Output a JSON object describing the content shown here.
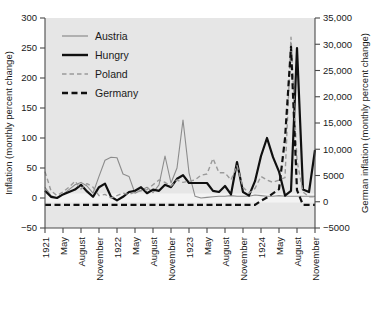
{
  "chart_data": {
    "type": "line",
    "title": "",
    "xlabel": "",
    "ylabel": "Inflation (monthly percent change)",
    "y2label": "German inflation (monthly percent change)",
    "grid": false,
    "legend_position": "top-left",
    "ylim": [
      -50,
      300
    ],
    "y2lim": [
      -5000,
      35000
    ],
    "yticks": [
      "300",
      "250",
      "200",
      "150",
      "100",
      "50",
      "0",
      "-50"
    ],
    "ytick_values": [
      300,
      250,
      200,
      150,
      100,
      50,
      0,
      -50
    ],
    "y2ticks": [
      "35,000",
      "30,000",
      "25,000",
      "20,000",
      "15,000",
      "10,000",
      "5000",
      "0",
      "-5000"
    ],
    "y2tick_values": [
      35000,
      30000,
      25000,
      20000,
      15000,
      10000,
      5000,
      0,
      -5000
    ],
    "xticks": [
      "1921",
      "May",
      "August",
      "November",
      "1922",
      "May",
      "August",
      "November",
      "1923",
      "May",
      "August",
      "November",
      "1924",
      "May",
      "August",
      "November"
    ],
    "x": [
      "1921-02",
      "1921-03",
      "1921-04",
      "1921-05",
      "1921-06",
      "1921-07",
      "1921-08",
      "1921-09",
      "1921-10",
      "1921-11",
      "1921-12",
      "1922-01",
      "1922-02",
      "1922-03",
      "1922-04",
      "1922-05",
      "1922-06",
      "1922-07",
      "1922-08",
      "1922-09",
      "1922-10",
      "1922-11",
      "1922-12",
      "1923-01",
      "1923-02",
      "1923-03",
      "1923-04",
      "1923-05",
      "1923-06",
      "1923-07",
      "1923-08",
      "1923-09",
      "1923-10",
      "1923-11",
      "1923-12",
      "1924-01",
      "1924-02",
      "1924-03",
      "1924-04",
      "1924-05",
      "1924-06",
      "1924-07",
      "1924-08",
      "1924-09",
      "1924-10",
      "1924-11"
    ],
    "series": [
      {
        "name": "Austria",
        "color": "#8c8c8c",
        "style": "solid",
        "width": 1.1,
        "axis": "left",
        "values": [
          18,
          4,
          0,
          6,
          14,
          22,
          26,
          20,
          8,
          36,
          63,
          68,
          67,
          40,
          36,
          8,
          13,
          18,
          9,
          22,
          70,
          25,
          50,
          130,
          42,
          3,
          0,
          1,
          2,
          3,
          3,
          4,
          3,
          3,
          3,
          5,
          4,
          3,
          3,
          4,
          3,
          3,
          3,
          3,
          3,
          3
        ]
      },
      {
        "name": "Hungry",
        "color": "#101010",
        "style": "solid",
        "width": 2.2,
        "axis": "left",
        "values": [
          12,
          2,
          0,
          6,
          10,
          14,
          22,
          11,
          2,
          18,
          24,
          2,
          -4,
          2,
          10,
          12,
          18,
          8,
          14,
          12,
          22,
          18,
          32,
          38,
          25,
          25,
          25,
          25,
          12,
          10,
          20,
          6,
          60,
          10,
          4,
          28,
          70,
          100,
          68,
          44,
          4,
          12,
          250,
          14,
          10,
          80
        ]
      },
      {
        "name": "Poland",
        "color": "#9a9a9a",
        "style": "dashed",
        "width": 1.4,
        "axis": "left",
        "values": [
          44,
          12,
          4,
          10,
          18,
          28,
          15,
          24,
          18,
          4,
          6,
          0,
          4,
          8,
          6,
          10,
          12,
          14,
          22,
          30,
          26,
          20,
          30,
          26,
          28,
          30,
          38,
          40,
          66,
          42,
          42,
          30,
          54,
          18,
          8,
          16,
          36,
          30,
          26,
          30,
          34,
          268,
          62,
          10,
          2,
          2
        ]
      },
      {
        "name": "Germany",
        "color": "#101010",
        "style": "dashed",
        "width": 2.2,
        "axis": "right",
        "values": [
          -600,
          -600,
          -600,
          -600,
          -600,
          -600,
          -600,
          -600,
          -600,
          -600,
          -600,
          -600,
          -600,
          -600,
          -600,
          -600,
          -600,
          -600,
          -600,
          -600,
          -600,
          -600,
          -600,
          -600,
          -600,
          -600,
          -600,
          -600,
          -600,
          -600,
          -600,
          -600,
          -600,
          -600,
          -600,
          -600,
          200,
          800,
          1600,
          2400,
          12000,
          29500,
          2200,
          -600,
          -600,
          -600
        ]
      }
    ],
    "legend": [
      {
        "label": "Austria",
        "color": "#8c8c8c",
        "style": "solid",
        "width": 1.2
      },
      {
        "label": "Hungry",
        "color": "#101010",
        "style": "solid",
        "width": 2.4
      },
      {
        "label": "Poland",
        "color": "#9a9a9a",
        "style": "dashed",
        "width": 1.6
      },
      {
        "label": "Germany",
        "color": "#101010",
        "style": "dashed",
        "width": 2.4
      }
    ],
    "colors": {
      "plot_background": "#e6e6e6",
      "page_background": "#ffffff",
      "axis": "#4a4a4a",
      "text": "#1a1a1a"
    }
  }
}
